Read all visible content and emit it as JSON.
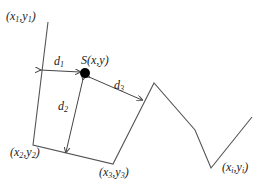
{
  "diagram": {
    "polyline_points": [
      [
        48,
        22
      ],
      [
        33,
        145
      ],
      [
        113,
        164
      ],
      [
        154,
        83
      ],
      [
        195,
        130
      ],
      [
        211,
        168
      ],
      [
        252,
        117
      ]
    ],
    "point_S": {
      "cx": 85,
      "cy": 73,
      "r": 5
    },
    "arrows": {
      "d1": {
        "from": [
          40,
          70
        ],
        "to": [
          80,
          72
        ]
      },
      "d2": {
        "from": [
          83,
          78
        ],
        "to": [
          66,
          152
        ]
      },
      "d3": {
        "from": [
          88,
          76
        ],
        "to": [
          142,
          100
        ]
      }
    },
    "stroke_color": "#555555",
    "dot_color": "#000000"
  },
  "labels": {
    "p1": {
      "base": "(x",
      "sub1": "1",
      "mid": ",y",
      "sub2": "1",
      "end": ")"
    },
    "p2": {
      "base": "(x",
      "sub1": "2",
      "mid": ",y",
      "sub2": "2",
      "end": ")"
    },
    "p3": {
      "base": "(x",
      "sub1": "3",
      "mid": ",y",
      "sub2": "3",
      "end": ")"
    },
    "pi": {
      "base": "(x",
      "sub1": "i",
      "mid": ",y",
      "sub2": "i",
      "end": ")"
    },
    "S": "S(x,y)",
    "d1": {
      "base": "d",
      "sub": "1"
    },
    "d2": {
      "base": "d",
      "sub": "2"
    },
    "d3": {
      "base": "d",
      "sub": "3"
    }
  }
}
